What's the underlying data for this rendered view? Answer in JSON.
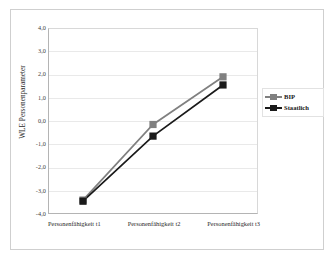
{
  "chart_data": {
    "type": "line",
    "title": "",
    "xlabel": "",
    "ylabel": "WLE Personenparameter",
    "categories": [
      "Personenfähigkeit t1",
      "Personenfähigkeit t2",
      "Personenfähigkeit t3"
    ],
    "series": [
      {
        "name": "BIP",
        "values": [
          -3.4,
          -0.15,
          1.9
        ],
        "color": "#808080",
        "marker": "square"
      },
      {
        "name": "Staatlich",
        "values": [
          -3.45,
          -0.65,
          1.55
        ],
        "color": "#1a1a1a",
        "marker": "square"
      }
    ],
    "ylim": [
      -4.0,
      4.0
    ],
    "ytick_labels": [
      "4,0",
      "3,0",
      "2,0",
      "1,0",
      "0,0",
      "-1,0",
      "-2,0",
      "-3,0",
      "-4,0"
    ],
    "ytick_values": [
      4.0,
      3.0,
      2.0,
      1.0,
      0.0,
      -1.0,
      -2.0,
      -3.0,
      -4.0
    ],
    "grid": true,
    "legend_position": "right"
  },
  "legend": {
    "items": [
      {
        "label": "BIP",
        "color": "#808080"
      },
      {
        "label": "Staatlich",
        "color": "#1a1a1a"
      }
    ]
  },
  "axis": {
    "y_title": "WLE Personenparameter"
  }
}
